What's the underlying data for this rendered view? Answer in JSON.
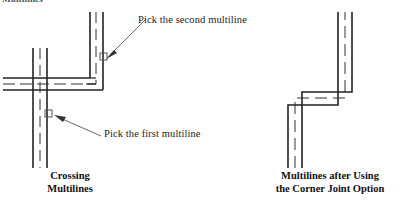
{
  "figure": {
    "title_cutoff": "Multilines",
    "annotations": [
      {
        "id": "pick-second",
        "text": "Pick the second multiline",
        "pick_box": {
          "x": 103,
          "y": 56,
          "size": 7
        },
        "leader": {
          "x1": 145,
          "y1": 19,
          "x2": 106,
          "y2": 56
        }
      },
      {
        "id": "pick-first",
        "text": "Pick the first multiline",
        "pick_box": {
          "x": 48,
          "y": 113,
          "size": 7
        },
        "leader": {
          "x1": 100,
          "y1": 137,
          "x2": 54,
          "y2": 118
        }
      }
    ],
    "captions": {
      "left": {
        "line1": "Crossing",
        "line2": "Multilines"
      },
      "right": {
        "line1": "Multilines after Using",
        "line2": "the Corner Joint Option"
      }
    },
    "colors": {
      "line": "#222222",
      "dashed_line": "#333333",
      "text": "#222222",
      "background": "#ffffff"
    },
    "left_diagram": {
      "label": "crossing-multilines",
      "horizontal_multiline": {
        "y_offsets": [
          78,
          84,
          90
        ],
        "x_start": 3,
        "x_end": 103
      },
      "vertical_multiline": {
        "x_offsets": [
          33,
          40,
          47
        ],
        "y_start": 48,
        "y_end": 165
      },
      "corner_multiline": {
        "x_offsets": [
          90,
          96,
          103
        ],
        "y_offsets": [
          78,
          84,
          90
        ],
        "v_top": 12
      }
    },
    "right_diagram": {
      "label": "corner-joint-result",
      "vertical_leg": {
        "x_offsets": [
          288,
          295,
          302
        ],
        "y_bottom": 165
      },
      "upper_leg": {
        "x_offsets": [
          338,
          345,
          352
        ],
        "y_top": 12
      },
      "corner_y": [
        92,
        98,
        105
      ],
      "middle_line_dashed": true
    }
  }
}
